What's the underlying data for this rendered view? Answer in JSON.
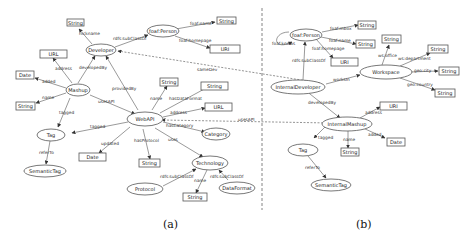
{
  "captions": {
    "a": "(a)",
    "b": "(b)"
  },
  "diagram_a": {
    "nodes": {
      "foaf_person": "foaf:Person",
      "developer": "Developer",
      "mashup": "Mashup",
      "webapi": "WebAPI",
      "tag": "Tag",
      "semantictag": "SemanticTag",
      "category": "Category",
      "technology": "Technology",
      "protocol": "Protocol",
      "dataformat": "DataFormat",
      "str_nick": "String",
      "str_fname": "String",
      "uri_home": "URI",
      "url_mashup": "URL",
      "date_added": "Date",
      "str_mname": "String",
      "str_apiname": "String",
      "str_dataformat": "String",
      "url_api": "URL",
      "date_updated": "Date",
      "str_protocol": "String",
      "str_techname": "String"
    },
    "edges": {
      "nickname": "nickname",
      "rdfs_subclassof": "rdfs:subClassOf",
      "foaf_name": "foaf:name",
      "foaf_homepage": "foaf:homepage",
      "address": "address",
      "developedby": "developedBy",
      "added": "added",
      "name": "name",
      "usesapi": "usesAPI",
      "tagged": "tagged",
      "providedby": "providedBy",
      "api_name": "name",
      "hasdataformat": "hasDataFormat",
      "api_address": "address",
      "hascategory": "hasCategory",
      "api_tagged": "tagged",
      "updated": "updated",
      "hasprotocol": "hasProtocol",
      "uses": "uses",
      "referto": "referTo",
      "tech_subclass1": "rdfs:subClassOf",
      "tech_subclass2": "rdfs:subClassOf",
      "tech_name": "name"
    }
  },
  "cross_edges": {
    "samedev": "sameDev",
    "usesapi": "usesAPI"
  },
  "diagram_b": {
    "nodes": {
      "foaf_person": "foaf:Person",
      "internal_developer": "InternalDeveloper",
      "workspace": "Workspace",
      "internal_mashup": "InternalMashup",
      "tag": "Tag",
      "semantictag": "SemanticTag",
      "str_mbox": "String",
      "str_fname": "String",
      "uri_home": "URI",
      "str_office": "String",
      "str_dept": "String",
      "str_city": "String",
      "str_country": "String",
      "uri_address": "URI",
      "date_added": "Date",
      "str_name": "String"
    },
    "edges": {
      "foaf_knows": "foaf:knows",
      "foaf_mbox": "foaf:mbox",
      "foaf_name": "foaf:name",
      "foaf_homepage": "foaf:homepage",
      "rdfs_subclassof": "rdfs:subClassOf",
      "worksin": "worksIn",
      "ws_office": "ws:office",
      "ws_department": "ws:department",
      "geo_city": "geo:city",
      "geo_country": "geo:country",
      "developedby": "developedBy",
      "address": "address",
      "tagged": "tagged",
      "name": "name",
      "added": "added",
      "referto": "referTo"
    }
  }
}
